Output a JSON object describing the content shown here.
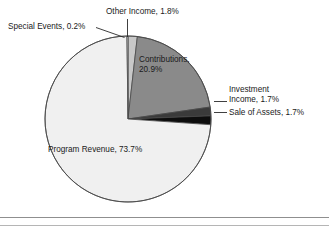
{
  "chart_data": {
    "type": "pie",
    "title": "",
    "subtitle": "",
    "xlabel": "",
    "ylabel": "",
    "legend_position": "none",
    "grid": false,
    "labels_position": "callout",
    "units": "percent",
    "categories": [
      "Other Income",
      "Contributions",
      "Investment Income",
      "Sale of Assets",
      "Program Revenue",
      "Special Events"
    ],
    "values": [
      1.8,
      20.9,
      1.7,
      1.7,
      73.7,
      0.2
    ],
    "slices": [
      {
        "name": "Other Income",
        "value": 1.8,
        "label": "Other Income, 1.8%",
        "color": "#c8c8c8",
        "start_angle": 0.0,
        "end_angle": 6.48,
        "label_placement": "outside-top",
        "leader": "vertical"
      },
      {
        "name": "Contributions",
        "value": 20.9,
        "label_line1": "Contributions,",
        "label_line2": "20.9%",
        "label": "Contributions, 20.9%",
        "color": "#8a8a8a",
        "start_angle": 6.48,
        "end_angle": 81.72,
        "label_placement": "inside",
        "leader": "none"
      },
      {
        "name": "Investment Income",
        "value": 1.7,
        "label_line1": "Investment",
        "label_line2": "Income, 1.7%",
        "label": "Investment Income, 1.7%",
        "color": "#3a3a3a",
        "start_angle": 81.72,
        "end_angle": 87.84,
        "label_placement": "outside-right",
        "leader": "horizontal"
      },
      {
        "name": "Sale of Assets",
        "value": 1.7,
        "label": "Sale of Assets, 1.7%",
        "color": "#0d0d0d",
        "start_angle": 87.84,
        "end_angle": 93.96,
        "label_placement": "outside-right",
        "leader": "horizontal"
      },
      {
        "name": "Program Revenue",
        "value": 73.7,
        "label": "Program Revenue, 73.7%",
        "color": "#f0f0f0",
        "start_angle": 93.96,
        "end_angle": 359.28,
        "label_placement": "inside",
        "leader": "none"
      },
      {
        "name": "Special Events",
        "value": 0.2,
        "label": "Special Events, 0.2%",
        "color": "#fcfcfc",
        "start_angle": 359.28,
        "end_angle": 360.0,
        "label_placement": "outside-top-left",
        "leader": "diagonal"
      }
    ],
    "total": 100.0,
    "stroke_color": "#4a4a4a",
    "background": "#ffffff"
  },
  "labels": {
    "special_events": "Special Events, 0.2%",
    "other_income": "Other Income, 1.8%",
    "contributions_line1": "Contributions,",
    "contributions_line2": "20.9%",
    "investment_income_line1": "Investment",
    "investment_income_line2": "Income, 1.7%",
    "sale_of_assets": "Sale of Assets, 1.7%",
    "program_revenue": "Program Revenue, 73.7%"
  }
}
